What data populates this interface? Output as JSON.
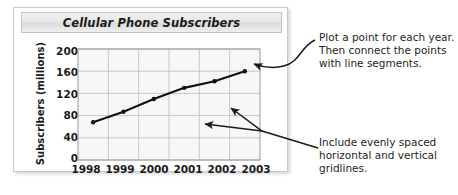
{
  "chart_panel": {
    "title": "Cellular Phone Subscribers"
  },
  "annotations": {
    "top": "Plot a point for each year.\nThen connect the points\nwith line segments.",
    "bottom": "Include evenly spaced\nhorizontal and vertical\ngridlines."
  },
  "chart_data": {
    "type": "line",
    "title": "Cellular Phone Subscribers",
    "xlabel": "",
    "ylabel": "Subscribers (millions)",
    "categories": [
      "1998",
      "1999",
      "2000",
      "2001",
      "2002",
      "2003"
    ],
    "values": [
      68,
      87,
      110,
      130,
      142,
      160
    ],
    "series": [
      {
        "name": "Subscribers (millions)",
        "values": [
          68,
          87,
          110,
          130,
          142,
          160
        ]
      }
    ],
    "ylim": [
      0,
      200
    ],
    "yticks": [
      0,
      40,
      80,
      120,
      160,
      200
    ],
    "xticks": [
      "1998",
      "1999",
      "2000",
      "2001",
      "2002",
      "2003"
    ],
    "grid": true,
    "legend": false,
    "line_color": "#111111",
    "marker_color": "#111111",
    "gridline_color": "#bdbdbd",
    "plot_background": "#f7f7f7"
  }
}
